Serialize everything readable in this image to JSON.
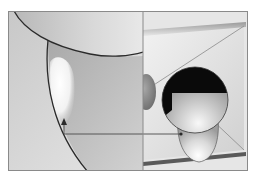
{
  "diagram": {
    "title": "",
    "panels": [
      {
        "id": "left",
        "description": "Magnified view with curved boundary and highlighted region"
      },
      {
        "id": "right",
        "description": "Perspective view with dark sphere and elongated capsule"
      }
    ],
    "pointer": {
      "description": "Arrow linking point on capsule to highlighted region"
    },
    "colors": {
      "background": "#ffffff",
      "frame": "#8a8a8a",
      "panel_light": "#d6d6d6",
      "panel_mid": "#bdbdbd",
      "panel_dark": "#9e9e9e",
      "outline": "#2a2a2a",
      "sphere_dark": "#0a0a0a",
      "highlight": "#f4f4f4"
    }
  }
}
